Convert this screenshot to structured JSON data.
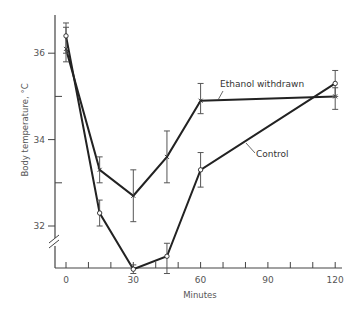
{
  "chart_data": {
    "type": "line",
    "title": "",
    "xlabel": "Minutes",
    "ylabel": "Body temperature, °C",
    "xlim": [
      0,
      120
    ],
    "ylim": [
      31,
      36.8
    ],
    "x_ticks": [
      0,
      30,
      60,
      90,
      120
    ],
    "x_minor_tick_step": 10,
    "y_ticks": [
      32,
      34,
      36
    ],
    "y_minor_ticks": [
      33,
      35
    ],
    "y_axis_break": true,
    "grid": false,
    "legend": "inline labels",
    "series": [
      {
        "name": "Ethanol withdrawn",
        "marker": "x",
        "x": [
          0,
          15,
          30,
          45,
          60,
          120
        ],
        "values": [
          36.1,
          33.3,
          32.7,
          33.6,
          34.9,
          35.0
        ],
        "error_low": [
          35.8,
          33.0,
          32.1,
          33.0,
          34.6,
          34.7
        ],
        "error_high": [
          36.6,
          33.6,
          33.3,
          34.2,
          35.3,
          35.2
        ]
      },
      {
        "name": "Control",
        "marker": "circle",
        "x": [
          0,
          15,
          30,
          45,
          60,
          120
        ],
        "values": [
          36.4,
          32.3,
          31.0,
          31.3,
          33.3,
          35.3
        ],
        "error_low": [
          36.0,
          32.0,
          30.9,
          30.9,
          32.9,
          35.0
        ],
        "error_high": [
          36.7,
          32.6,
          31.1,
          31.6,
          33.7,
          35.6
        ]
      }
    ]
  },
  "labels": {
    "xlabel": "Minutes",
    "ylabel": "Body temperature, °C",
    "series_ethanol": "Ethanol withdrawn",
    "series_control": "Control",
    "x_ticks": [
      "0",
      "30",
      "60",
      "90",
      "120"
    ],
    "y_ticks": [
      "32",
      "34",
      "36"
    ]
  },
  "colors": {
    "line": "#222222",
    "axis": "#444444",
    "text": "#555555"
  }
}
